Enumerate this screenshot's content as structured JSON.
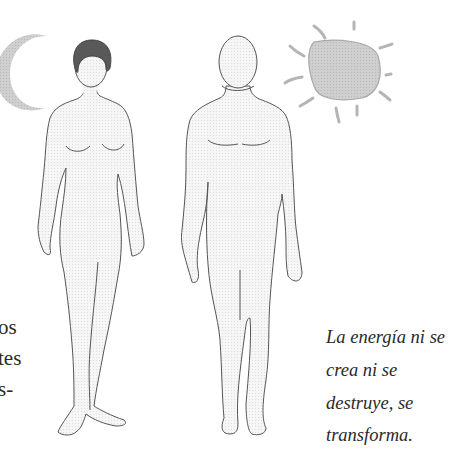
{
  "illustration": {
    "figures": [
      {
        "name": "female-figure",
        "hair_color": "#595959"
      },
      {
        "name": "male-figure"
      }
    ],
    "symbols": [
      {
        "name": "moon",
        "shape": "crescent",
        "color": "#c8c8c8"
      },
      {
        "name": "sun",
        "shape": "circle-with-rays",
        "color": "#c4c4c4"
      }
    ],
    "colors": {
      "body_fill": "#f2f2f2",
      "outline": "#555555",
      "background": "#ffffff"
    }
  },
  "left_column_fragments": [
    "os",
    "tes",
    "s-"
  ],
  "caption": {
    "lines": [
      "La energía ni se",
      "crea ni se",
      "destruye, se",
      "transforma."
    ]
  }
}
